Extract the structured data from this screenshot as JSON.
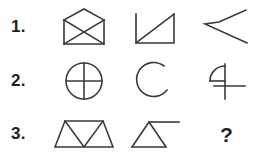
{
  "page": {
    "background_color": "#ffffff",
    "stroke_color": "#3a3a3a",
    "text_color": "#1f1f1f"
  },
  "rows": [
    {
      "label": "1.",
      "cells": [
        {
          "name": "envelope-with-x-shape",
          "description": "Open envelope: square body with an upward V flap on top and an X crossing the body",
          "glyph": "envelope-x"
        },
        {
          "name": "open-square-with-diagonal-shape",
          "description": "Left vertical, bottom horizontal and right vertical lines with a diagonal from bottom-left to top-right",
          "glyph": "bracket-diagonal"
        },
        {
          "name": "chevron-parallelogram-shape",
          "description": "Three connected lines forming an open leftward chevron like a flattened parallelogram",
          "glyph": "chevron-open"
        }
      ]
    },
    {
      "label": "2.",
      "cells": [
        {
          "name": "circle-with-cross-shape",
          "description": "Circle divided into four quadrants by a vertical and a horizontal diameter",
          "glyph": "circle-cross"
        },
        {
          "name": "open-arc-shape",
          "description": "Almost complete circle with a gap opening at the upper right",
          "glyph": "arc-open"
        },
        {
          "name": "four-like-shape",
          "description": "Quarter arc loop at upper left attached to a vertical stroke crossed by a horizontal bar",
          "glyph": "figure-four"
        }
      ]
    },
    {
      "label": "3.",
      "cells": [
        {
          "name": "trapezoid-zigzag-shape",
          "description": "Trapezoid containing a zigzag that forms three alternating triangles",
          "glyph": "trapezoid-zigzag"
        },
        {
          "name": "triangle-with-tail-shape",
          "description": "Triangle with a horizontal line extending to the right from its apex",
          "glyph": "triangle-tail"
        },
        {
          "name": "missing-answer",
          "description": "Question mark marking the missing final figure",
          "glyph": "question-mark",
          "text": "?"
        }
      ]
    }
  ]
}
